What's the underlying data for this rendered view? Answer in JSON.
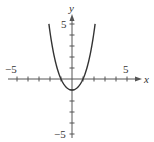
{
  "chart_data": {
    "type": "line",
    "title": "",
    "xlabel": "x",
    "ylabel": "y",
    "xlim": [
      -5.5,
      6.5
    ],
    "ylim": [
      -5.5,
      6
    ],
    "grid": false,
    "x_tick_labels": [
      "-5",
      "5"
    ],
    "y_tick_labels": [
      "5",
      "-5"
    ],
    "series": [
      {
        "name": "curve",
        "x": [
          -2.1,
          -1.8,
          -1.5,
          -1.2,
          -1.0,
          -0.6,
          -0.3,
          0,
          0.3,
          0.6,
          1.0,
          1.2,
          1.5,
          1.8,
          2.1
        ],
        "y": [
          5.0,
          2.97,
          1.55,
          0.51,
          0.0,
          -0.66,
          -0.92,
          -1.0,
          -0.92,
          -0.66,
          0.0,
          0.51,
          1.55,
          2.97,
          5.0
        ]
      }
    ]
  },
  "labels": {
    "x_axis": "x",
    "y_axis": "y",
    "x_neg": "−5",
    "x_pos": "5",
    "y_pos": "5",
    "y_neg": "−5"
  },
  "colors": {
    "axis": "#555555",
    "curve": "#333333"
  }
}
